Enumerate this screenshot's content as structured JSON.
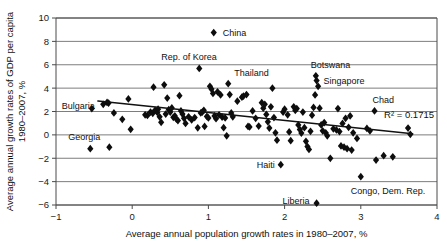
{
  "chart_data": {
    "type": "scatter",
    "title": "",
    "xlabel": "Average annual population growth rates in 1980–2007, %",
    "ylabel": "Average annual growth rates of GDP per capita, 1980–2007, %",
    "xlim": [
      -1,
      4
    ],
    "ylim": [
      -6,
      10
    ],
    "xticks": [
      -1,
      0,
      1,
      2,
      3,
      4
    ],
    "xticklabels": [
      "−1",
      "0",
      "1",
      "2",
      "3",
      "4"
    ],
    "yticks": [
      -6,
      -4,
      -2,
      0,
      2,
      4,
      6,
      8,
      10
    ],
    "yticklabels": [
      "−6",
      "−4",
      "−2",
      "0",
      "2",
      "4",
      "6",
      "8",
      "10"
    ],
    "grid": "horizontal",
    "legend": "none",
    "marker": "diamond",
    "marker_color": "#0d0d0d",
    "series": [
      {
        "name": "Countries",
        "points": [
          [
            -0.53,
            2.25
          ],
          [
            -0.38,
            2.62
          ],
          [
            -0.33,
            2.78
          ],
          [
            -0.31,
            2.72
          ],
          [
            -0.24,
            1.88
          ],
          [
            -0.13,
            1.33
          ],
          [
            -0.05,
            3.08
          ],
          [
            -0.02,
            0.48
          ],
          [
            -0.55,
            -1.18
          ],
          [
            -0.3,
            -1.05
          ],
          [
            0.17,
            1.72
          ],
          [
            0.2,
            1.66
          ],
          [
            0.24,
            1.95
          ],
          [
            0.27,
            1.85
          ],
          [
            0.28,
            4.08
          ],
          [
            0.3,
            2.1
          ],
          [
            0.33,
            1.92
          ],
          [
            0.34,
            2.2
          ],
          [
            0.36,
            1.55
          ],
          [
            0.38,
            1.08
          ],
          [
            0.42,
            4.28
          ],
          [
            0.44,
            1.78
          ],
          [
            0.46,
            3.15
          ],
          [
            0.48,
            2.15
          ],
          [
            0.5,
            1.95
          ],
          [
            0.52,
            2.3
          ],
          [
            0.54,
            1.5
          ],
          [
            0.56,
            1.62
          ],
          [
            0.58,
            1.35
          ],
          [
            0.6,
            1.22
          ],
          [
            0.62,
            3.35
          ],
          [
            0.64,
            2.05
          ],
          [
            0.66,
            1.78
          ],
          [
            0.68,
            1.42
          ],
          [
            0.7,
            0.98
          ],
          [
            0.74,
            1.55
          ],
          [
            0.78,
            1.28
          ],
          [
            0.82,
            1.48
          ],
          [
            0.86,
            0.6
          ],
          [
            0.88,
            5.68
          ],
          [
            0.9,
            1.88
          ],
          [
            0.92,
            1.95
          ],
          [
            0.94,
            2.1
          ],
          [
            0.95,
            0.72
          ],
          [
            0.98,
            1.58
          ],
          [
            1.0,
            1.45
          ],
          [
            1.02,
            4.15
          ],
          [
            1.04,
            3.92
          ],
          [
            1.06,
            3.55
          ],
          [
            1.07,
            8.75
          ],
          [
            1.08,
            1.62
          ],
          [
            1.1,
            1.38
          ],
          [
            1.12,
            3.68
          ],
          [
            1.14,
            1.72
          ],
          [
            1.16,
            3.42
          ],
          [
            1.18,
            1.52
          ],
          [
            1.2,
            0.62
          ],
          [
            1.22,
            1.45
          ],
          [
            1.24,
            -0.08
          ],
          [
            1.26,
            4.38
          ],
          [
            1.28,
            3.45
          ],
          [
            1.3,
            1.88
          ],
          [
            1.32,
            1.55
          ],
          [
            1.38,
            2.88
          ],
          [
            1.44,
            3.22
          ],
          [
            1.46,
            3.32
          ],
          [
            1.5,
            3.45
          ],
          [
            1.52,
            0.72
          ],
          [
            1.54,
            0.68
          ],
          [
            1.58,
            2.05
          ],
          [
            1.62,
            1.42
          ],
          [
            1.66,
            0.75
          ],
          [
            1.7,
            2.75
          ],
          [
            1.72,
            2.28
          ],
          [
            1.74,
            2.62
          ],
          [
            1.76,
            1.75
          ],
          [
            1.78,
            1.12
          ],
          [
            1.8,
            0.58
          ],
          [
            1.82,
            2.4
          ],
          [
            1.84,
            4.0
          ],
          [
            1.86,
            1.48
          ],
          [
            1.88,
            0.18
          ],
          [
            1.9,
            -0.45
          ],
          [
            1.95,
            -2.55
          ],
          [
            1.98,
            1.95
          ],
          [
            2.0,
            2.2
          ],
          [
            2.04,
            1.72
          ],
          [
            2.06,
            0.25
          ],
          [
            2.08,
            -0.5
          ],
          [
            2.12,
            2.4
          ],
          [
            2.14,
            2.1
          ],
          [
            2.16,
            2.25
          ],
          [
            2.18,
            0.85
          ],
          [
            2.2,
            0.45
          ],
          [
            2.22,
            0.15
          ],
          [
            2.24,
            1.95
          ],
          [
            2.26,
            0.62
          ],
          [
            2.28,
            -0.55
          ],
          [
            2.3,
            -1.0
          ],
          [
            2.32,
            -1.25
          ],
          [
            2.34,
            0.3
          ],
          [
            2.36,
            1.68
          ],
          [
            2.38,
            2.35
          ],
          [
            2.4,
            3.42
          ],
          [
            2.41,
            5.05
          ],
          [
            2.42,
            4.65
          ],
          [
            2.42,
            -5.85
          ],
          [
            2.44,
            4.15
          ],
          [
            2.46,
            2.28
          ],
          [
            2.48,
            0.85
          ],
          [
            2.5,
            0.35
          ],
          [
            2.52,
            1.05
          ],
          [
            2.54,
            0.18
          ],
          [
            2.56,
            -0.08
          ],
          [
            2.6,
            -2.0
          ],
          [
            2.64,
            0.52
          ],
          [
            2.68,
            0.42
          ],
          [
            2.7,
            2.25
          ],
          [
            2.72,
            0.28
          ],
          [
            2.74,
            -0.95
          ],
          [
            2.76,
            0.98
          ],
          [
            2.78,
            -1.05
          ],
          [
            2.8,
            1.42
          ],
          [
            2.82,
            -1.18
          ],
          [
            2.84,
            0.65
          ],
          [
            2.86,
            1.62
          ],
          [
            2.88,
            -1.3
          ],
          [
            2.9,
            0.18
          ],
          [
            2.95,
            -0.3
          ],
          [
            3.0,
            -3.58
          ],
          [
            3.08,
            0.55
          ],
          [
            3.12,
            0.35
          ],
          [
            3.18,
            2.05
          ],
          [
            3.2,
            -2.15
          ],
          [
            3.3,
            -1.78
          ],
          [
            3.42,
            -1.88
          ],
          [
            3.62,
            0.58
          ],
          [
            3.65,
            0.05
          ]
        ]
      }
    ],
    "trendline": {
      "x0": -0.45,
      "y0": 2.9,
      "x1": 3.68,
      "y1": 0.1,
      "r_squared_label": "R² = 0.1715"
    },
    "annotations": [
      {
        "name": "china",
        "text": "China",
        "x": 1.07,
        "y": 8.75,
        "dx": 9,
        "dy": 3.5
      },
      {
        "name": "rep-of-korea",
        "text": "Rep. of Korea",
        "x": 0.88,
        "y": 5.68,
        "dx": -38,
        "dy": -8
      },
      {
        "name": "thailand",
        "text": "Thailand",
        "x": 1.26,
        "y": 4.38,
        "dx": 6,
        "dy": -8
      },
      {
        "name": "botswana",
        "text": "Botswana",
        "x": 2.41,
        "y": 5.05,
        "dx": -5,
        "dy": -8
      },
      {
        "name": "singapore",
        "text": "Singapore",
        "x": 2.42,
        "y": 4.65,
        "dx": 7,
        "dy": 3.5
      },
      {
        "name": "chad",
        "text": "Chad",
        "x": 3.18,
        "y": 2.05,
        "dx": -2,
        "dy": -8
      },
      {
        "name": "bulgaria",
        "text": "Bulgaria",
        "x": -0.53,
        "y": 2.25,
        "dx": -30,
        "dy": 0
      },
      {
        "name": "georgia",
        "text": "Georgia",
        "x": -0.55,
        "y": -1.18,
        "dx": -22,
        "dy": -9
      },
      {
        "name": "haiti",
        "text": "Haiti",
        "x": 1.95,
        "y": -2.55,
        "dx": -24,
        "dy": 3.5
      },
      {
        "name": "liberia",
        "text": "Liberia",
        "x": 2.42,
        "y": -5.85,
        "dx": -34,
        "dy": 1
      },
      {
        "name": "congo-dem-rep",
        "text": "Congo, Dem. Rep.",
        "x": 3.0,
        "y": -3.58,
        "dx": -10,
        "dy": 17
      }
    ]
  }
}
